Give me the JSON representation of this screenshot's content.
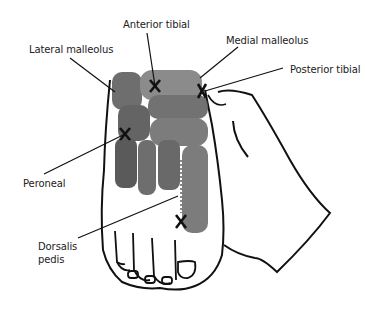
{
  "figure": {
    "labels": {
      "anterior_tibial": "Anterior tibial",
      "lateral_malleolus": "Lateral malleolus",
      "medial_malleolus": "Medial malleolus",
      "posterior_tibial": "Posterior tibial",
      "peroneal": "Peroneal",
      "dorsalis_pedis_line1": "Dorsalis",
      "dorsalis_pedis_line2": "pedis"
    },
    "markers": [
      "anterior-tibial-x",
      "posterior-tibial-x",
      "peroneal-x",
      "dorsalis-pedis-x"
    ],
    "colors": {
      "ink": "#111111",
      "shade": "#6b6b6b",
      "background": "#ffffff"
    }
  }
}
